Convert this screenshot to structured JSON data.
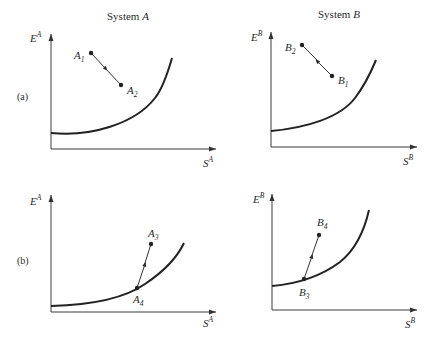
{
  "headers": {
    "system_a": "System",
    "system_a_var": "A",
    "system_b": "System",
    "system_b_var": "B"
  },
  "rows": {
    "a": "(a)",
    "b": "(b)"
  },
  "axes": {
    "a": {
      "y": "E",
      "y_sup": "A",
      "x": "S",
      "x_sup": "A"
    },
    "b": {
      "y": "E",
      "y_sup": "B",
      "x": "S",
      "x_sup": "B"
    }
  },
  "points": {
    "A1": {
      "name": "A",
      "sub": "1"
    },
    "A2": {
      "name": "A",
      "sub": "2"
    },
    "A3": {
      "name": "A",
      "sub": "3"
    },
    "A4": {
      "name": "A",
      "sub": "4"
    },
    "B1": {
      "name": "B",
      "sub": "1"
    },
    "B2": {
      "name": "B",
      "sub": "2"
    },
    "B3": {
      "name": "B",
      "sub": "3"
    },
    "B4": {
      "name": "B",
      "sub": "4"
    }
  },
  "colors": {
    "ink": "#222222",
    "background": "#ffffff"
  }
}
